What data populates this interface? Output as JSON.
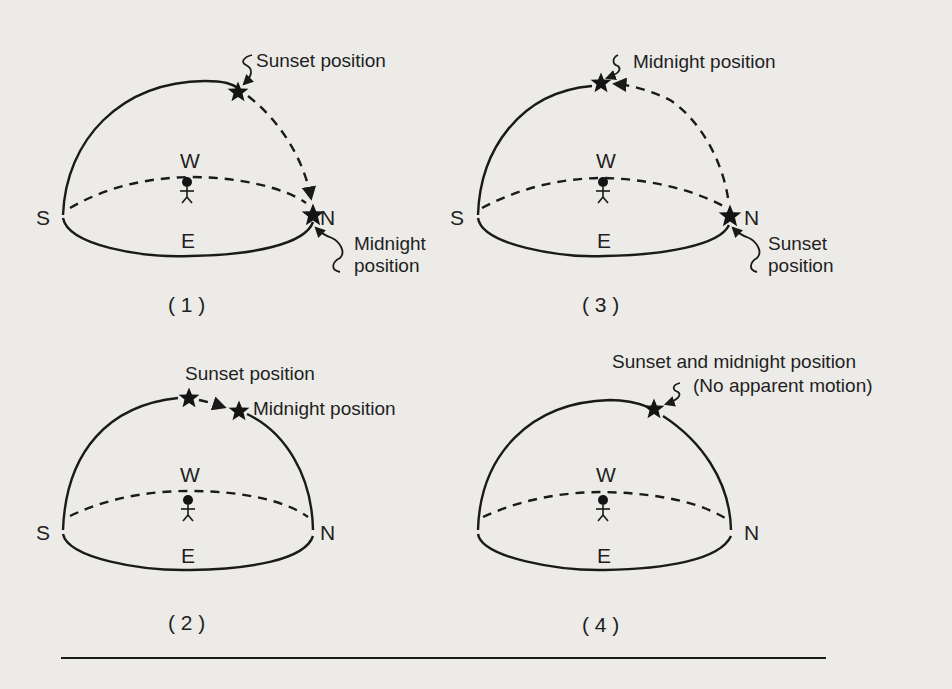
{
  "figure": {
    "colors": {
      "ink": "#1a1a1a",
      "paper": "#ecebe8"
    },
    "compass": {
      "south": "S",
      "north": "N",
      "west": "W",
      "east": "E"
    },
    "panels": [
      {
        "id": "1",
        "caption": "( 1 )",
        "labels": {
          "top": "Sunset position",
          "bottom_line1": "Midnight",
          "bottom_line2": "position"
        },
        "stars": [
          "sunset-position",
          "midnight-position"
        ]
      },
      {
        "id": "2",
        "caption": "( 2 )",
        "labels": {
          "sunset": "Sunset position",
          "midnight": "Midnight position"
        },
        "stars": [
          "sunset-position",
          "midnight-position"
        ]
      },
      {
        "id": "3",
        "caption": "( 3 )",
        "labels": {
          "top": "Midnight position",
          "bottom_line1": "Sunset",
          "bottom_line2": "position"
        },
        "stars": [
          "midnight-position",
          "sunset-position"
        ]
      },
      {
        "id": "4",
        "caption": "( 4 )",
        "labels": {
          "line1": "Sunset and midnight position",
          "line2": "(No apparent motion)"
        },
        "stars": [
          "sunset-and-midnight-position"
        ]
      }
    ]
  }
}
